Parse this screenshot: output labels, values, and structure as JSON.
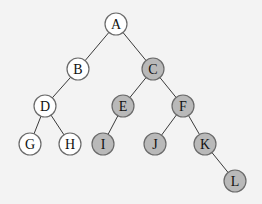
{
  "diagram": {
    "type": "binary-tree",
    "colors": {
      "background": "#f3f3f3",
      "white_node": "#ffffff",
      "gray_node": "#b9b9b9",
      "edge": "#3a3a3a",
      "node_border": "#6a6a6a"
    },
    "radius": 11,
    "nodes": [
      {
        "id": "A",
        "label": "A",
        "x": 116,
        "y": 24,
        "fill": "white"
      },
      {
        "id": "B",
        "label": "B",
        "x": 78,
        "y": 69,
        "fill": "white"
      },
      {
        "id": "C",
        "label": "C",
        "x": 153,
        "y": 69,
        "fill": "gray"
      },
      {
        "id": "D",
        "label": "D",
        "x": 45,
        "y": 106,
        "fill": "white"
      },
      {
        "id": "E",
        "label": "E",
        "x": 123,
        "y": 106,
        "fill": "gray"
      },
      {
        "id": "F",
        "label": "F",
        "x": 183,
        "y": 106,
        "fill": "gray"
      },
      {
        "id": "G",
        "label": "G",
        "x": 30,
        "y": 144,
        "fill": "white"
      },
      {
        "id": "H",
        "label": "H",
        "x": 70,
        "y": 144,
        "fill": "white"
      },
      {
        "id": "I",
        "label": "I",
        "x": 103,
        "y": 144,
        "fill": "gray"
      },
      {
        "id": "J",
        "label": "J",
        "x": 155,
        "y": 144,
        "fill": "gray"
      },
      {
        "id": "K",
        "label": "K",
        "x": 205,
        "y": 144,
        "fill": "gray"
      },
      {
        "id": "L",
        "label": "L",
        "x": 235,
        "y": 181,
        "fill": "gray"
      }
    ],
    "edges": [
      [
        "A",
        "B"
      ],
      [
        "A",
        "C"
      ],
      [
        "B",
        "D"
      ],
      [
        "C",
        "E"
      ],
      [
        "C",
        "F"
      ],
      [
        "D",
        "G"
      ],
      [
        "D",
        "H"
      ],
      [
        "E",
        "I"
      ],
      [
        "F",
        "J"
      ],
      [
        "F",
        "K"
      ],
      [
        "K",
        "L"
      ]
    ]
  }
}
